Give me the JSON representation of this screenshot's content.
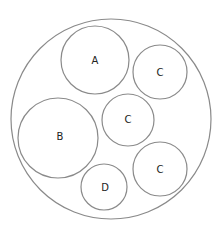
{
  "diagram": {
    "type": "nested-circles",
    "line_color": "#8a8a8a",
    "text_color": "#222222",
    "background": "#ffffff",
    "container": {
      "cx": 111,
      "cy": 119,
      "r": 100
    },
    "circles": [
      {
        "label": "A",
        "cx": 95,
        "cy": 60,
        "r": 34
      },
      {
        "label": "C",
        "cx": 160,
        "cy": 72,
        "r": 27
      },
      {
        "label": "C",
        "cx": 128,
        "cy": 120,
        "r": 26
      },
      {
        "label": "B",
        "cx": 58,
        "cy": 138,
        "r": 40
      },
      {
        "label": "C",
        "cx": 160,
        "cy": 169,
        "r": 27
      },
      {
        "label": "D",
        "cx": 104,
        "cy": 187,
        "r": 23
      }
    ]
  }
}
